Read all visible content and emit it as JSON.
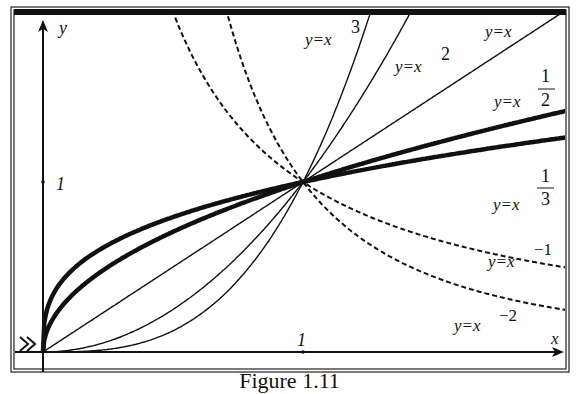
{
  "caption": "Figure 1.11",
  "chart_data": {
    "type": "line",
    "title": "",
    "xlabel": "x",
    "ylabel": "y",
    "xlim": [
      -0.1,
      2.0
    ],
    "ylim": [
      -0.1,
      2.0
    ],
    "ticks": {
      "x": [
        {
          "value": 1,
          "label": "1"
        }
      ],
      "y": [
        {
          "value": 1,
          "label": "1"
        }
      ]
    },
    "grid": false,
    "legend": "inline labels",
    "common_point": [
      1,
      1
    ],
    "series": [
      {
        "name": "y=x^3",
        "label": "y=x",
        "exp_label": "3",
        "exponent": 3,
        "style": "solid",
        "weight": "thin"
      },
      {
        "name": "y=x^2",
        "label": "y=x",
        "exp_label": "2",
        "exponent": 2,
        "style": "solid",
        "weight": "thin"
      },
      {
        "name": "y=x",
        "label": "y=x",
        "exp_label": "",
        "exponent": 1,
        "style": "solid",
        "weight": "thin"
      },
      {
        "name": "y=x^(1/2)",
        "label": "y=x",
        "exp_num": "1",
        "exp_den": "2",
        "exponent": 0.5,
        "style": "solid",
        "weight": "thick"
      },
      {
        "name": "y=x^(1/3)",
        "label": "y=x",
        "exp_num": "1",
        "exp_den": "3",
        "exponent": 0.3333,
        "style": "solid",
        "weight": "thick"
      },
      {
        "name": "y=x^-1",
        "label": "y=x",
        "exp_label": "−1",
        "exponent": -1,
        "style": "dashed",
        "weight": "thin"
      },
      {
        "name": "y=x^-2",
        "label": "y=x",
        "exp_label": "−2",
        "exponent": -2,
        "style": "dashed",
        "weight": "thin"
      }
    ]
  },
  "axes": {
    "x_label": "x",
    "y_label": "y",
    "x_tick": "1",
    "y_tick": "1"
  }
}
